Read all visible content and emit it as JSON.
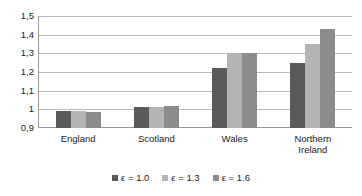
{
  "chart_data": {
    "type": "bar",
    "title": "",
    "subtitle": "",
    "xlabel": "",
    "ylabel": "",
    "categories": [
      "England",
      "Scotland",
      "Wales",
      "Northern\nIreland"
    ],
    "series": [
      {
        "name": "ε = 1.0",
        "color": "#5a5a5a",
        "values": [
          0.99,
          1.01,
          1.22,
          1.25
        ]
      },
      {
        "name": "ε = 1.3",
        "color": "#b4b4b4",
        "values": [
          0.99,
          1.01,
          1.3,
          1.35
        ]
      },
      {
        "name": "ε = 1.6",
        "color": "#8c8c8c",
        "values": [
          0.985,
          1.02,
          1.3,
          1.43
        ]
      }
    ],
    "ylim": [
      0.9,
      1.5
    ],
    "ytick_values": [
      0.9,
      1.0,
      1.1,
      1.2,
      1.3,
      1.4,
      1.5
    ],
    "ytick_labels": [
      "0,9",
      "1",
      "1,1",
      "1,2",
      "1,3",
      "1,4",
      "1,5"
    ],
    "grid": true,
    "grid_axis": "y",
    "legend_position": "bottom",
    "decimal_separator": ",",
    "axis_color": "#9a9a9a",
    "grid_color": "#b9b9b9",
    "background_color": "#ffffff"
  }
}
